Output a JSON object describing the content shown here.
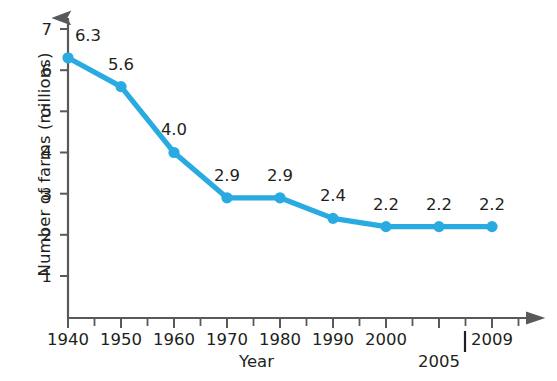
{
  "chart_data": {
    "type": "line",
    "title": "",
    "subtitle": "",
    "xlabel": "Year",
    "ylabel": "Number of farms (millions)",
    "categories": [
      "1940",
      "1950",
      "1960",
      "1970",
      "1980",
      "1990",
      "2000",
      "2005",
      "2009"
    ],
    "values": [
      6.3,
      5.6,
      4.0,
      2.9,
      2.9,
      2.4,
      2.2,
      2.2,
      2.2
    ],
    "point_labels": [
      "6.3",
      "5.6",
      "4.0",
      "2.9",
      "2.9",
      "2.4",
      "2.2",
      "2.2",
      "2.2"
    ],
    "x_tick_labels": [
      "1940",
      "1950",
      "1960",
      "1970",
      "1980",
      "1990",
      "2000",
      "2005",
      "2009"
    ],
    "x_tick_label_second_row": "2005",
    "y_tick_labels": [
      "1",
      "2",
      "3",
      "4",
      "5",
      "6",
      "7"
    ],
    "y_ticks": [
      1,
      2,
      3,
      4,
      5,
      6,
      7
    ],
    "ylim": [
      0,
      7.6
    ],
    "grid": false,
    "legend": false,
    "legend_position": "none",
    "series": [
      {
        "name": "Number of farms",
        "values": [
          6.3,
          5.6,
          4.0,
          2.9,
          2.9,
          2.4,
          2.2,
          2.2,
          2.2
        ]
      }
    ],
    "minor_ticks": true,
    "axis_arrows": [
      "x-right",
      "y-up"
    ],
    "colors": {
      "line": "#29ABE2",
      "marker": "#29ABE2",
      "axis": "#58595b",
      "text": "#231f20",
      "background": "#ffffff"
    }
  }
}
